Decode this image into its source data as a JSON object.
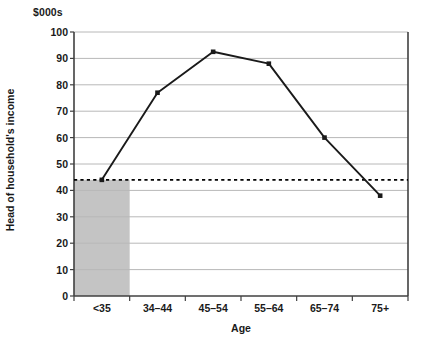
{
  "chart_data": {
    "type": "line",
    "title": "",
    "unit_label": "$000s",
    "xlabel": "Age",
    "ylabel": "Head of household's income",
    "categories": [
      "<35",
      "34–44",
      "45–54",
      "55–64",
      "65–74",
      "75+"
    ],
    "series": [
      {
        "name": "Head of household's income",
        "values": [
          44,
          77,
          92.5,
          88,
          60,
          38
        ],
        "marker": "square",
        "color": "#1a1a1a"
      }
    ],
    "reference_line": {
      "name": "<35 income level",
      "value": 44,
      "style": "dashed",
      "color": "#000000"
    },
    "highlight_band": {
      "name": "<35 age band shading",
      "category": "<35",
      "color": "#c4c4c4"
    },
    "ylim": [
      0,
      100
    ],
    "ytick_labels": [
      "0",
      "10",
      "20",
      "30",
      "40",
      "50",
      "60",
      "70",
      "80",
      "90",
      "100"
    ],
    "ytick_values": [
      0,
      10,
      20,
      30,
      40,
      50,
      60,
      70,
      80,
      90,
      100
    ],
    "grid": "horizontal",
    "gridline_color": "#b8b8b8",
    "axis_color": "#404040",
    "legend": "none",
    "plot_background": "#ffffff"
  }
}
